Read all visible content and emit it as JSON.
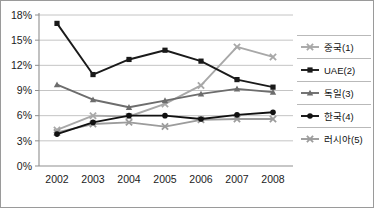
{
  "chart_data": {
    "type": "line",
    "title": "",
    "xlabel": "",
    "ylabel": "",
    "categories": [
      "2002",
      "2003",
      "2004",
      "2005",
      "2006",
      "2007",
      "2008"
    ],
    "ylim": [
      0,
      18
    ],
    "yticks": [
      "0%",
      "3%",
      "6%",
      "9%",
      "12%",
      "15%",
      "18%"
    ],
    "ytick_values": [
      0,
      3,
      6,
      9,
      12,
      15,
      18
    ],
    "grid": true,
    "legend_position": "right",
    "series": [
      {
        "name": "중국(1)",
        "values": [
          4.3,
          6.0,
          5.9,
          7.4,
          9.6,
          14.2,
          13.0
        ],
        "color": "#a8a8a8",
        "marker": "x"
      },
      {
        "name": "UAE(2)",
        "values": [
          17.0,
          10.9,
          12.7,
          13.8,
          12.5,
          10.3,
          9.4
        ],
        "color": "#1a1a1a",
        "marker": "square"
      },
      {
        "name": "독일(3)",
        "values": [
          9.7,
          7.9,
          7.0,
          7.8,
          8.6,
          9.2,
          8.8
        ],
        "color": "#6d6d6d",
        "marker": "triangle"
      },
      {
        "name": "한국(4)",
        "values": [
          3.8,
          5.2,
          6.0,
          6.0,
          5.6,
          6.1,
          6.4
        ],
        "color": "#111111",
        "marker": "circle"
      },
      {
        "name": "러시아(5)",
        "values": [
          4.0,
          5.0,
          5.2,
          4.7,
          5.5,
          5.6,
          5.6
        ],
        "color": "#9c9c9c",
        "marker": "x"
      }
    ]
  },
  "legend": {
    "items": [
      {
        "label": "중국(1)"
      },
      {
        "label": "UAE(2)"
      },
      {
        "label": "독일(3)"
      },
      {
        "label": "한국(4)"
      },
      {
        "label": "러시아(5)"
      }
    ]
  }
}
